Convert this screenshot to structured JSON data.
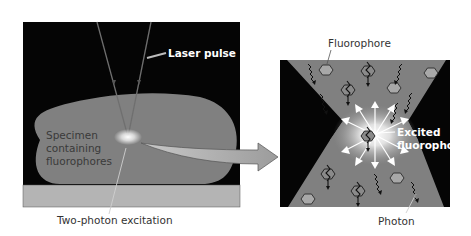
{
  "diagram": {
    "colors": {
      "background": "#ffffff",
      "panel_black": "#050505",
      "specimen": "#808080",
      "slide": "#b4b4b4",
      "laser_beam": "#7a7a7a",
      "arrow_fill": "#a9a9a9",
      "hexagon": "#a8a8a8",
      "glow": "#ffffff"
    },
    "left_panel": {
      "labels": {
        "laser_pulse": "Laser pulse",
        "specimen_line1": "Specimen",
        "specimen_line2": "containing",
        "specimen_line3": "fluorophores",
        "excitation": "Two-photon excitation"
      }
    },
    "right_panel": {
      "labels": {
        "fluorophore": "Fluorophore",
        "excited_line1": "Excited",
        "excited_line2": "fluorophore",
        "photon": "Photon"
      }
    }
  }
}
